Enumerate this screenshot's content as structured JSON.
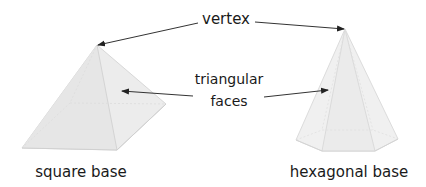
{
  "diagram": {
    "labels": {
      "vertex": "vertex",
      "triangular_faces_line1": "triangular",
      "triangular_faces_line2": "faces",
      "square_base": "square base",
      "hexagonal_base": "hexagonal base"
    },
    "shapes": [
      {
        "name": "square-based pyramid",
        "base": "square"
      },
      {
        "name": "hexagonal-based pyramid",
        "base": "hexagonal"
      }
    ],
    "colors": {
      "text": "#1a1a1a",
      "arrow": "#333333",
      "pyramid_fill": "#ececec",
      "pyramid_edge": "#d6d6d6"
    }
  }
}
